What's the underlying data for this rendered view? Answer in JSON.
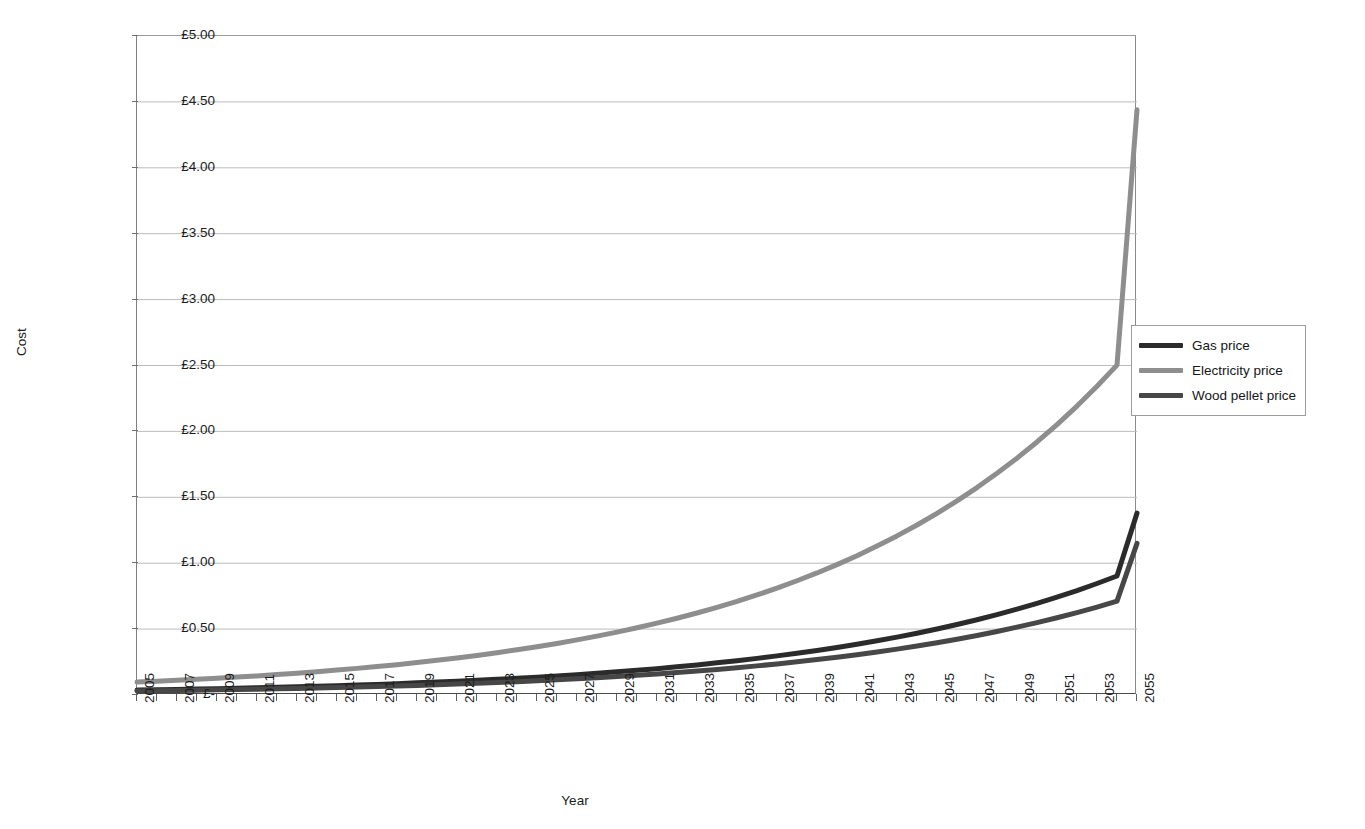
{
  "page": {
    "cut_off_header": "",
    "background": "#ffffff"
  },
  "chart_data": {
    "type": "line",
    "title": "",
    "xlabel": "Year",
    "ylabel": "Cost",
    "xlim": [
      2005,
      2055
    ],
    "ylim": [
      0,
      5
    ],
    "grid": true,
    "legend_position": "right",
    "y_tick_labels": [
      "£5.00",
      "£4.50",
      "£4.00",
      "£3.50",
      "£3.00",
      "£2.50",
      "£2.00",
      "£1.50",
      "£1.00",
      "£0.50",
      "£-"
    ],
    "y_tick_values": [
      5.0,
      4.5,
      4.0,
      3.5,
      3.0,
      2.5,
      2.0,
      1.5,
      1.0,
      0.5,
      0.0
    ],
    "x_tick_labels": [
      "2005",
      "2007",
      "2009",
      "2011",
      "2013",
      "2015",
      "2017",
      "2019",
      "2021",
      "2023",
      "2025",
      "2027",
      "2029",
      "2031",
      "2033",
      "2035",
      "2037",
      "2039",
      "2041",
      "2043",
      "2045",
      "2047",
      "2049",
      "2051",
      "2053",
      "2055"
    ],
    "x": [
      2005,
      2006,
      2007,
      2008,
      2009,
      2010,
      2011,
      2012,
      2013,
      2014,
      2015,
      2016,
      2017,
      2018,
      2019,
      2020,
      2021,
      2022,
      2023,
      2024,
      2025,
      2026,
      2027,
      2028,
      2029,
      2030,
      2031,
      2032,
      2033,
      2034,
      2035,
      2036,
      2037,
      2038,
      2039,
      2040,
      2041,
      2042,
      2043,
      2044,
      2045,
      2046,
      2047,
      2048,
      2049,
      2050,
      2051,
      2052,
      2053,
      2054,
      2055
    ],
    "series": [
      {
        "name": "Gas price",
        "color": "#2b2b2b",
        "width": 5,
        "values": [
          0.037,
          0.04,
          0.042,
          0.045,
          0.048,
          0.051,
          0.055,
          0.058,
          0.062,
          0.066,
          0.071,
          0.075,
          0.08,
          0.086,
          0.092,
          0.098,
          0.104,
          0.111,
          0.119,
          0.127,
          0.135,
          0.144,
          0.154,
          0.165,
          0.176,
          0.188,
          0.2,
          0.214,
          0.228,
          0.244,
          0.26,
          0.278,
          0.297,
          0.317,
          0.338,
          0.361,
          0.385,
          0.411,
          0.439,
          0.469,
          0.501,
          0.535,
          0.571,
          0.61,
          0.651,
          0.695,
          0.742,
          0.792,
          0.846,
          0.903,
          1.38
        ]
      },
      {
        "name": "Electricity price",
        "color": "#8e8e8e",
        "width": 5,
        "values": [
          0.098,
          0.104,
          0.111,
          0.119,
          0.127,
          0.136,
          0.145,
          0.155,
          0.165,
          0.177,
          0.189,
          0.202,
          0.216,
          0.23,
          0.246,
          0.263,
          0.281,
          0.3,
          0.321,
          0.343,
          0.366,
          0.391,
          0.418,
          0.447,
          0.477,
          0.51,
          0.545,
          0.582,
          0.622,
          0.665,
          0.71,
          0.759,
          0.811,
          0.867,
          0.926,
          0.989,
          1.057,
          1.13,
          1.207,
          1.29,
          1.378,
          1.473,
          1.574,
          1.682,
          1.797,
          1.92,
          2.052,
          2.192,
          2.343,
          2.503,
          4.44
        ]
      },
      {
        "name": "Wood pellet price",
        "color": "#474747",
        "width": 5,
        "values": [
          0.03,
          0.032,
          0.034,
          0.036,
          0.039,
          0.041,
          0.044,
          0.047,
          0.05,
          0.053,
          0.057,
          0.06,
          0.064,
          0.069,
          0.073,
          0.078,
          0.083,
          0.089,
          0.095,
          0.101,
          0.108,
          0.115,
          0.123,
          0.131,
          0.14,
          0.149,
          0.159,
          0.17,
          0.182,
          0.194,
          0.207,
          0.221,
          0.236,
          0.252,
          0.269,
          0.287,
          0.306,
          0.326,
          0.348,
          0.372,
          0.397,
          0.423,
          0.452,
          0.482,
          0.515,
          0.549,
          0.586,
          0.625,
          0.667,
          0.712,
          1.15
        ]
      }
    ],
    "legend": [
      {
        "label": "Gas price",
        "color": "#2b2b2b"
      },
      {
        "label": "Electricity price",
        "color": "#8e8e8e"
      },
      {
        "label": "Wood pellet price",
        "color": "#474747"
      }
    ]
  }
}
